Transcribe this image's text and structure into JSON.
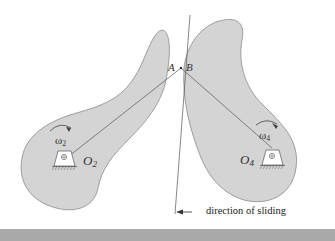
{
  "diagram": {
    "type": "mechanism",
    "contact_points": [
      {
        "id": "A",
        "label": "A"
      },
      {
        "id": "B",
        "label": "B"
      }
    ],
    "pivots": [
      {
        "id": "O2",
        "label": "O",
        "subscript": "2"
      },
      {
        "id": "O4",
        "label": "O",
        "subscript": "4"
      }
    ],
    "angular_velocities": [
      {
        "id": "omega2",
        "label": "ω",
        "subscript": "2",
        "direction": "clockwise"
      },
      {
        "id": "omega4",
        "label": "ω",
        "subscript": "4",
        "direction": "clockwise"
      }
    ],
    "annotations": {
      "sliding_caption": "direction of sliding"
    },
    "colors": {
      "link_fill": "#d4d4d4",
      "link_stroke": "#8a8a8a",
      "line": "#555555",
      "band": "#a9a9a9"
    }
  }
}
